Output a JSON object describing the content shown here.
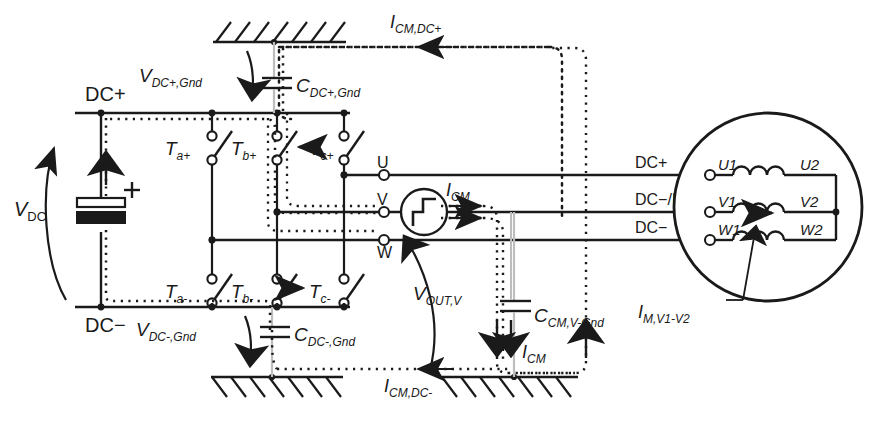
{
  "diagram": {
    "type": "electrical-schematic",
    "colors": {
      "line": "#1a1a1a",
      "dotted": "#2b2b2b",
      "background": "#ffffff"
    }
  },
  "rails": {
    "dc_plus": "DC+",
    "dc_minus": "DC−",
    "source_label": "V_DC"
  },
  "source": {
    "vdc": "V",
    "vdc_sub": "DC"
  },
  "switches": {
    "upper": [
      {
        "name": "T",
        "sub": "a+"
      },
      {
        "name": "T",
        "sub": "b+"
      },
      {
        "name": "T",
        "sub": "c+"
      }
    ],
    "lower": [
      {
        "name": "T",
        "sub": "a-"
      },
      {
        "name": "T",
        "sub": "b-"
      },
      {
        "name": "T",
        "sub": "c-"
      }
    ]
  },
  "phase_terminals": [
    {
      "label": "U"
    },
    {
      "label": "V"
    },
    {
      "label": "W"
    }
  ],
  "cable_labels": [
    {
      "label": "DC+"
    },
    {
      "label": "DC−/DC+"
    },
    {
      "label": "DC−"
    }
  ],
  "motor": {
    "windings": [
      {
        "left": "U1",
        "right": "U2"
      },
      {
        "left": "V1",
        "right": "V2"
      },
      {
        "left": "W1",
        "right": "W2"
      }
    ],
    "current_label": "I",
    "current_sub": "M,V1-V2"
  },
  "capacitors": [
    {
      "main": "C",
      "sub": "DC+,Gnd"
    },
    {
      "main": "C",
      "sub": "DC-,Gnd"
    },
    {
      "main": "C",
      "sub": "CM,V-Gnd"
    }
  ],
  "voltages": [
    {
      "main": "V",
      "sub": "DC+,Gnd"
    },
    {
      "main": "V",
      "sub": "DC-,Gnd"
    },
    {
      "main": "V",
      "sub": "OUT,V"
    }
  ],
  "currents": [
    {
      "main": "I",
      "sub": "CM,DC+"
    },
    {
      "main": "I",
      "sub": "CM,DC-"
    },
    {
      "main": "I",
      "sub": "CM"
    },
    {
      "main": "I",
      "sub": "CM"
    }
  ],
  "ground_symbol": "hatched-ground"
}
